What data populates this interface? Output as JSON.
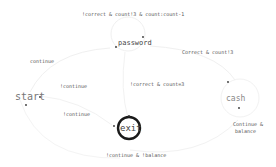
{
  "diagram": {
    "type": "state-machine",
    "states": [
      {
        "id": "start",
        "label": "start"
      },
      {
        "id": "password",
        "label": "password"
      },
      {
        "id": "cash",
        "label": "cash"
      },
      {
        "id": "exit",
        "label": "exit",
        "final": true
      }
    ],
    "transitions": [
      {
        "from": "password",
        "to": "password",
        "label": "!correct & count!3 & count:count-1"
      },
      {
        "from": "password",
        "to": "cash",
        "label": "Correct & count!3"
      },
      {
        "from": "start",
        "to": "password",
        "label": "continue"
      },
      {
        "from": "start",
        "to": "exit",
        "label": "!continue"
      },
      {
        "from": "exit",
        "to": "start",
        "label": "!continue"
      },
      {
        "from": "password",
        "to": "exit",
        "label": "!correct & count=3"
      },
      {
        "from": "cash",
        "to": "start",
        "label": "Continue & !balance"
      },
      {
        "from": "cash",
        "to": "start",
        "label": "Continue &\nbalance"
      }
    ]
  },
  "labels": {
    "self_loop": "!correct & count!3 & count:count-1",
    "pw_to_cash": "Correct & count!3",
    "start_to_pw": "continue",
    "start_to_exit": "!continue",
    "exit_to_start": "!continue",
    "pw_to_exit": "!correct & count=3",
    "cash_to_start_bottom": "!continue & !balance",
    "cash_balance_line1": "Continue &",
    "cash_balance_line2": "balance"
  },
  "nodes": {
    "start": "start",
    "password": "password",
    "cash": "cash",
    "exit": "exit"
  }
}
